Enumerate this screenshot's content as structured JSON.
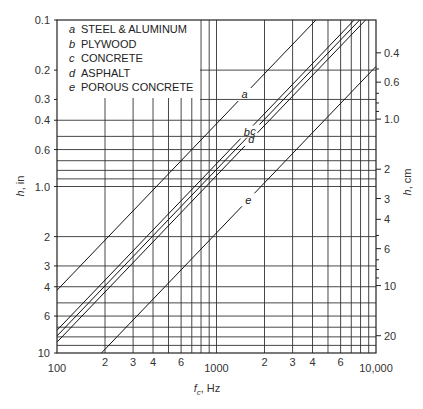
{
  "chart_data": {
    "type": "line",
    "title": "",
    "xlabel": "f_c , Hz",
    "ylabel": "h, in",
    "ylabel_right": "h, cm",
    "xscale": "log",
    "yscale": "log",
    "xlim": [
      100,
      10000
    ],
    "ylim": [
      10,
      0.1
    ],
    "y_inverted": true,
    "grid": true,
    "legend_position": "upper-left (inside)",
    "x_ticks": [
      {
        "value": 100,
        "label": "100"
      },
      {
        "value": 200,
        "label": "2"
      },
      {
        "value": 300,
        "label": "3"
      },
      {
        "value": 400,
        "label": "4"
      },
      {
        "value": 600,
        "label": "6"
      },
      {
        "value": 1000,
        "label": "1000"
      },
      {
        "value": 2000,
        "label": "2"
      },
      {
        "value": 3000,
        "label": "3"
      },
      {
        "value": 4000,
        "label": "4"
      },
      {
        "value": 6000,
        "label": "6"
      },
      {
        "value": 10000,
        "label": "10,000"
      }
    ],
    "x_gridlines": [
      200,
      300,
      400,
      500,
      600,
      700,
      800,
      900,
      1000,
      2000,
      3000,
      4000,
      5000,
      6000,
      7000,
      8000,
      9000
    ],
    "y_ticks_left": [
      {
        "value": 0.1,
        "label": "0.1"
      },
      {
        "value": 0.2,
        "label": "0.2"
      },
      {
        "value": 0.3,
        "label": "0.3"
      },
      {
        "value": 0.4,
        "label": "0.4"
      },
      {
        "value": 0.6,
        "label": "0.6"
      },
      {
        "value": 1.0,
        "label": "1.0"
      },
      {
        "value": 2,
        "label": "2"
      },
      {
        "value": 3,
        "label": "3"
      },
      {
        "value": 4,
        "label": "4"
      },
      {
        "value": 6,
        "label": "6"
      },
      {
        "value": 10,
        "label": "10"
      }
    ],
    "y_gridlines": [
      0.4,
      0.5,
      0.6,
      0.7,
      0.8,
      0.9,
      1.0,
      2,
      3,
      4,
      5,
      6,
      7,
      8,
      9
    ],
    "y_ticks_right_cm": [
      {
        "value": 0.4,
        "label": "0.4"
      },
      {
        "value": 0.6,
        "label": "0.6"
      },
      {
        "value": 1.0,
        "label": "1.0"
      },
      {
        "value": 2,
        "label": "2"
      },
      {
        "value": 3,
        "label": "3"
      },
      {
        "value": 4,
        "label": "4"
      },
      {
        "value": 6,
        "label": "6"
      },
      {
        "value": 10,
        "label": "10"
      },
      {
        "value": 20,
        "label": "20"
      }
    ],
    "y_minor_ticks_right_cm": [
      0.5,
      0.7,
      0.8,
      0.9,
      5,
      7,
      8,
      9
    ],
    "series": [
      {
        "key": "a",
        "name": "STEEL & ALUMINUM",
        "relation": "h = K / f",
        "K_in_Hz": 420,
        "x": [
          100,
          4200
        ],
        "y": [
          4.2,
          0.1
        ],
        "label_at": {
          "f": 1500,
          "h": 0.29
        }
      },
      {
        "key": "b",
        "name": "PLYWOOD",
        "relation": "h = K / f",
        "K_in_Hz": 730,
        "x": [
          100,
          7300
        ],
        "y": [
          7.3,
          0.1
        ],
        "label_at": {
          "f": 1550,
          "h": 0.5
        }
      },
      {
        "key": "c",
        "name": "CONCRETE",
        "relation": "h = K / f",
        "K_in_Hz": 790,
        "x": [
          100,
          7900
        ],
        "y": [
          7.9,
          0.1
        ],
        "label_at": {
          "f": 1700,
          "h": 0.5
        }
      },
      {
        "key": "d",
        "name": "ASPHALT",
        "relation": "h = K / f",
        "K_in_Hz": 860,
        "x": [
          100,
          8600
        ],
        "y": [
          8.6,
          0.1
        ],
        "label_at": {
          "f": 1650,
          "h": 0.6
        }
      },
      {
        "key": "e",
        "name": "POROUS CONCRETE",
        "relation": "h = K / f",
        "K_in_Hz": 1900,
        "x": [
          190,
          10000
        ],
        "y": [
          10,
          0.19
        ],
        "label_at": {
          "f": 1580,
          "h": 1.3
        }
      }
    ]
  },
  "legend": {
    "items": [
      {
        "key": "a",
        "label": "STEEL & ALUMINUM"
      },
      {
        "key": "b",
        "label": "PLYWOOD"
      },
      {
        "key": "c",
        "label": "CONCRETE"
      },
      {
        "key": "d",
        "label": "ASPHALT"
      },
      {
        "key": "e",
        "label": "POROUS CONCRETE"
      }
    ]
  },
  "axes": {
    "x_label_main": "f",
    "x_label_sub": "c",
    "x_label_unit": ", Hz",
    "y_left_label_var": "h",
    "y_left_label_unit": ", in",
    "y_right_label_var": "h",
    "y_right_label_unit": ", cm"
  }
}
